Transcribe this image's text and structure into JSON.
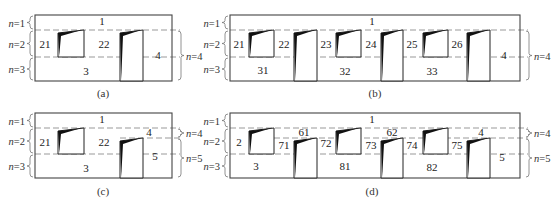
{
  "stroke_color": "#444444",
  "dash_color": "#999999",
  "fill_dark": "#111111",
  "panels": [
    {
      "id": "a",
      "caption": "(a)",
      "frame": {
        "x": 35,
        "y": 15,
        "w": 137,
        "h": 66
      },
      "dashes": [
        30,
        57
      ],
      "right_dashes": [
        30
      ],
      "left_levels": [
        {
          "label": "n=1",
          "y1": 15,
          "y2": 30
        },
        {
          "label": "n=2",
          "y1": 30,
          "y2": 57
        },
        {
          "label": "n=3",
          "y1": 57,
          "y2": 81
        }
      ],
      "right_levels": [
        {
          "label": "n=4",
          "y1": 30,
          "y2": 81
        }
      ],
      "boxes": [
        {
          "x": 58,
          "y": 30,
          "w": 26,
          "h": 27,
          "type": "short"
        },
        {
          "x": 120,
          "y": 30,
          "w": 23,
          "h": 51,
          "type": "tall"
        }
      ],
      "labels": [
        {
          "text": "1",
          "x": 102,
          "y": 25
        },
        {
          "text": "21",
          "x": 45,
          "y": 48
        },
        {
          "text": "22",
          "x": 104,
          "y": 48
        },
        {
          "text": "3",
          "x": 86,
          "y": 75
        },
        {
          "text": "4",
          "x": 158,
          "y": 59
        }
      ]
    },
    {
      "id": "b",
      "caption": "(b)",
      "frame": {
        "x": 230,
        "y": 15,
        "w": 290,
        "h": 66
      },
      "dashes": [
        30,
        57
      ],
      "right_dashes": [
        30
      ],
      "left_levels": [
        {
          "label": "n=1",
          "y1": 15,
          "y2": 30
        },
        {
          "label": "n=2",
          "y1": 30,
          "y2": 57
        },
        {
          "label": "n=3",
          "y1": 57,
          "y2": 81
        }
      ],
      "right_levels": [
        {
          "label": "n=4",
          "y1": 30,
          "y2": 81
        }
      ],
      "boxes": [
        {
          "x": 249,
          "y": 30,
          "w": 25,
          "h": 27,
          "type": "short"
        },
        {
          "x": 294,
          "y": 30,
          "w": 23,
          "h": 51,
          "type": "tall"
        },
        {
          "x": 336,
          "y": 30,
          "w": 25,
          "h": 27,
          "type": "short"
        },
        {
          "x": 381,
          "y": 30,
          "w": 22,
          "h": 51,
          "type": "tall"
        },
        {
          "x": 423,
          "y": 30,
          "w": 25,
          "h": 27,
          "type": "short"
        },
        {
          "x": 467,
          "y": 30,
          "w": 23,
          "h": 51,
          "type": "tall"
        }
      ],
      "labels": [
        {
          "text": "1",
          "x": 372,
          "y": 25
        },
        {
          "text": "21",
          "x": 239,
          "y": 48
        },
        {
          "text": "22",
          "x": 284,
          "y": 48
        },
        {
          "text": "23",
          "x": 326,
          "y": 48
        },
        {
          "text": "24",
          "x": 371,
          "y": 48
        },
        {
          "text": "25",
          "x": 412,
          "y": 48
        },
        {
          "text": "26",
          "x": 457,
          "y": 48
        },
        {
          "text": "31",
          "x": 263,
          "y": 74
        },
        {
          "text": "32",
          "x": 345,
          "y": 75
        },
        {
          "text": "33",
          "x": 432,
          "y": 75
        },
        {
          "text": "4",
          "x": 504,
          "y": 59
        }
      ]
    },
    {
      "id": "c",
      "caption": "(c)",
      "frame": {
        "x": 35,
        "y": 113,
        "w": 137,
        "h": 65
      },
      "dashes": [
        128,
        154
      ],
      "right_dashes": [
        128,
        138
      ],
      "partial_dash": {
        "x1": 120,
        "x2": 172,
        "y": 138
      },
      "left_levels": [
        {
          "label": "n=1",
          "y1": 113,
          "y2": 128
        },
        {
          "label": "n=2",
          "y1": 128,
          "y2": 154
        },
        {
          "label": "n=3",
          "y1": 154,
          "y2": 178
        }
      ],
      "right_levels": [
        {
          "label": "n=4",
          "y1": 128,
          "y2": 138
        },
        {
          "label": "n=5",
          "y1": 138,
          "y2": 178
        }
      ],
      "boxes": [
        {
          "x": 58,
          "y": 128,
          "w": 26,
          "h": 26,
          "type": "short"
        },
        {
          "x": 120,
          "y": 138,
          "w": 23,
          "h": 40,
          "type": "tall"
        }
      ],
      "labels": [
        {
          "text": "1",
          "x": 102,
          "y": 123
        },
        {
          "text": "4",
          "x": 149,
          "y": 136
        },
        {
          "text": "21",
          "x": 45,
          "y": 146
        },
        {
          "text": "22",
          "x": 104,
          "y": 146
        },
        {
          "text": "3",
          "x": 86,
          "y": 172
        },
        {
          "text": "5",
          "x": 155,
          "y": 160
        }
      ]
    },
    {
      "id": "d",
      "caption": "(d)",
      "frame": {
        "x": 230,
        "y": 113,
        "w": 290,
        "h": 65
      },
      "dashes": [
        128,
        154
      ],
      "right_dashes": [
        128,
        138
      ],
      "partial_dash": {
        "x1": 274,
        "x2": 520,
        "y": 138
      },
      "left_levels": [
        {
          "label": "n=1",
          "y1": 113,
          "y2": 128
        },
        {
          "label": "n=2",
          "y1": 128,
          "y2": 154
        },
        {
          "label": "n=3",
          "y1": 154,
          "y2": 178
        }
      ],
      "right_levels": [
        {
          "label": "n=4",
          "y1": 128,
          "y2": 138
        },
        {
          "label": "n=5",
          "y1": 138,
          "y2": 178
        }
      ],
      "boxes": [
        {
          "x": 249,
          "y": 128,
          "w": 25,
          "h": 26,
          "type": "short"
        },
        {
          "x": 294,
          "y": 138,
          "w": 23,
          "h": 40,
          "type": "tall"
        },
        {
          "x": 336,
          "y": 128,
          "w": 25,
          "h": 26,
          "type": "short"
        },
        {
          "x": 381,
          "y": 138,
          "w": 22,
          "h": 40,
          "type": "tall"
        },
        {
          "x": 423,
          "y": 128,
          "w": 25,
          "h": 26,
          "type": "short"
        },
        {
          "x": 467,
          "y": 138,
          "w": 23,
          "h": 40,
          "type": "tall"
        }
      ],
      "labels": [
        {
          "text": "1",
          "x": 372,
          "y": 123
        },
        {
          "text": "61",
          "x": 304,
          "y": 136
        },
        {
          "text": "62",
          "x": 392,
          "y": 136
        },
        {
          "text": "4",
          "x": 481,
          "y": 136
        },
        {
          "text": "2",
          "x": 239,
          "y": 146
        },
        {
          "text": "71",
          "x": 284,
          "y": 149
        },
        {
          "text": "72",
          "x": 326,
          "y": 147
        },
        {
          "text": "73",
          "x": 371,
          "y": 149
        },
        {
          "text": "74",
          "x": 412,
          "y": 149
        },
        {
          "text": "75",
          "x": 457,
          "y": 149
        },
        {
          "text": "3",
          "x": 256,
          "y": 170
        },
        {
          "text": "81",
          "x": 345,
          "y": 170
        },
        {
          "text": "82",
          "x": 432,
          "y": 171
        },
        {
          "text": "5",
          "x": 502,
          "y": 161
        }
      ]
    }
  ],
  "captions": {
    "a": {
      "text": "(a)",
      "x": 103,
      "y": 97
    },
    "b": {
      "text": "(b)",
      "x": 375,
      "y": 97
    },
    "c": {
      "text": "(c)",
      "x": 103,
      "y": 195
    },
    "d": {
      "text": "(d)",
      "x": 372,
      "y": 195
    }
  }
}
